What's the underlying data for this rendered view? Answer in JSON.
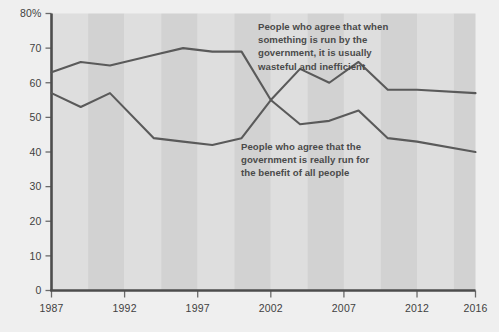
{
  "chart_data": {
    "type": "line",
    "title": "",
    "subtitle": "",
    "xlabel": "",
    "ylabel": "",
    "xlim": [
      1987,
      2016
    ],
    "ylim": [
      0,
      80
    ],
    "grid": false,
    "legend_position": "inline-annotations",
    "x_tick_labels": [
      "1987",
      "1992",
      "1997",
      "2002",
      "2007",
      "2012",
      "2016"
    ],
    "x_tick_values": [
      1987,
      1992,
      1997,
      2002,
      2007,
      2012,
      2016
    ],
    "y_tick_labels": [
      "0",
      "10",
      "20",
      "30",
      "40",
      "50",
      "60",
      "70",
      "80%"
    ],
    "y_tick_values": [
      0,
      10,
      20,
      30,
      40,
      50,
      60,
      70,
      80
    ],
    "background_bands": {
      "enabled": true,
      "orientation": "vertical",
      "color_a": "#d2d2d2",
      "color_b": "#dedede",
      "band_width_years": 2.5
    },
    "series": [
      {
        "name": "People who agree that when something is run by the government, it is usually wasteful and inefficient",
        "color": "#5a5a5a",
        "x": [
          1987,
          1989,
          1991,
          1994,
          1996,
          1998,
          2000,
          2002,
          2004,
          2006,
          2008,
          2010,
          2012,
          2016
        ],
        "values": [
          63,
          66,
          65,
          68,
          70,
          69,
          69,
          55,
          64,
          60,
          66,
          58,
          58,
          57
        ]
      },
      {
        "name": "People who agree that the government is really run for the benefit of all people",
        "color": "#5a5a5a",
        "x": [
          1987,
          1989,
          1991,
          1994,
          1996,
          1998,
          2000,
          2002,
          2004,
          2006,
          2008,
          2010,
          2012,
          2016
        ],
        "values": [
          57,
          53,
          57,
          44,
          43,
          42,
          44,
          55,
          48,
          49,
          52,
          44,
          43,
          40
        ]
      }
    ],
    "annotations": [
      {
        "id": "annotation-upper",
        "lines": [
          "People who agree that when",
          "something is run by the",
          "government, it is usually",
          "wasteful and inefficient"
        ],
        "x_px": 258,
        "y_px": 30,
        "color": "#4a4a4a"
      },
      {
        "id": "annotation-lower",
        "lines": [
          "People who agree that the",
          "government is really run for",
          "the benefit of all people"
        ],
        "x_px": 241,
        "y_px": 150,
        "color": "#4a4a4a"
      }
    ],
    "colors": {
      "page_background": "#efefef",
      "axis": "#4d4d4d",
      "tick_text": "#3f3f3f",
      "line": "#5a5a5a",
      "annotation_text": "#4a4a4a"
    }
  }
}
